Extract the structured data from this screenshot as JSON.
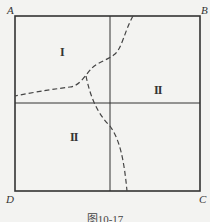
{
  "figure": {
    "corners": {
      "top_left": "A",
      "top_right": "B",
      "bottom_right": "C",
      "bottom_left": "D"
    },
    "regions": {
      "upper_left": "I",
      "right": "II",
      "lower_left": "II"
    },
    "caption": "图10-17",
    "colors": {
      "background": "#f3f3f1",
      "lines": "#333333",
      "dashed": "#444444"
    }
  }
}
